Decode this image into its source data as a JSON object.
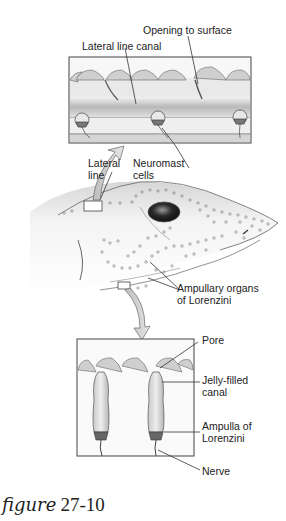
{
  "figure": {
    "caption_word": "figure",
    "caption_number": "27-10"
  },
  "top_panel": {
    "title": "Lateral line system cross-section",
    "labels": {
      "opening": "Opening to surface",
      "canal": "Lateral line canal",
      "neuromast_1": "Neuromast",
      "neuromast_2": "cells"
    }
  },
  "shark_head": {
    "labels": {
      "lateral_1": "Lateral",
      "lateral_2": "line",
      "ampullary_1": "Ampullary organs",
      "ampullary_2": "of Lorenzini"
    }
  },
  "bottom_panel": {
    "labels": {
      "pore": "Pore",
      "jelly_1": "Jelly-filled",
      "jelly_2": "canal",
      "ampulla_1": "Ampulla of",
      "ampulla_2": "Lorenzini",
      "nerve": "Nerve"
    }
  },
  "colors": {
    "line": "#333333",
    "fill_light": "#e6e6e6",
    "fill_mid": "#bdbdbd",
    "fill_dark": "#8a8a8a"
  }
}
